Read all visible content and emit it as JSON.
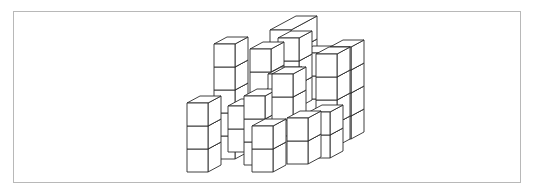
{
  "figure": {
    "title": "",
    "colors": {
      "background": "#ffffff",
      "frame": "#b8b8b8",
      "stroke": "#2a2a2a",
      "face": "#ffffff"
    },
    "cube": {
      "width": 21,
      "height": 23,
      "depth_dx": 13,
      "depth_dy": -7
    },
    "stacks": [
      {
        "x": 270,
        "y": 99,
        "levels": 3,
        "depth": 2
      },
      {
        "x": 300,
        "y": 122,
        "levels": 3,
        "depth": 1
      },
      {
        "x": 278,
        "y": 107,
        "levels": 3,
        "depth": 1
      },
      {
        "x": 330,
        "y": 139,
        "levels": 4,
        "depth": 1
      },
      {
        "x": 250,
        "y": 95,
        "levels": 2,
        "depth": 1
      },
      {
        "x": 214,
        "y": 159,
        "levels": 5,
        "depth": 1
      },
      {
        "x": 316,
        "y": 146,
        "levels": 4,
        "depth": 1
      },
      {
        "x": 258,
        "y": 140,
        "levels": 2,
        "depth": 1
      },
      {
        "x": 228,
        "y": 152,
        "levels": 2,
        "depth": 1
      },
      {
        "x": 268,
        "y": 120,
        "levels": 2,
        "depth": 1
      },
      {
        "x": 309,
        "y": 158,
        "levels": 2,
        "depth": 1
      },
      {
        "x": 244,
        "y": 165,
        "levels": 3,
        "depth": 1
      },
      {
        "x": 272,
        "y": 120,
        "levels": 2,
        "depth": 1
      },
      {
        "x": 187,
        "y": 172,
        "levels": 3,
        "depth": 1
      },
      {
        "x": 287,
        "y": 164,
        "levels": 2,
        "depth": 1
      },
      {
        "x": 252,
        "y": 172,
        "levels": 2,
        "depth": 1
      }
    ]
  }
}
